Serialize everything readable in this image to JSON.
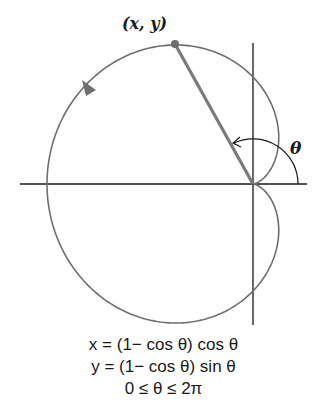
{
  "diagram": {
    "point_label": "(x, y)",
    "angle_label": "θ",
    "equations": [
      "x = (1− cos θ) cos θ",
      "y = (1− cos θ) sin θ",
      "0 ≤ θ ≤ 2π"
    ],
    "colors": {
      "curve": "#6e6e6e",
      "radius_line": "#7a7a7a",
      "axes": "#1a1a1a",
      "background": "#ffffff"
    },
    "curve": {
      "type": "cardioid",
      "r": "1 − cos θ",
      "direction": "counterclockwise"
    }
  }
}
